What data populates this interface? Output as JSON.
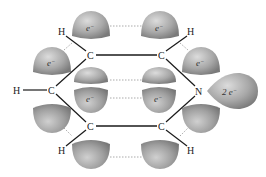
{
  "diagram": {
    "colors": {
      "background": "#ffffff",
      "lobe_light": "#d4d4d4",
      "lobe_dark": "#8a8a8a",
      "bond": "#1a1a1a",
      "dotted": "#aaaaaa",
      "text": "#222222"
    },
    "atoms": [
      {
        "id": "c1",
        "label": "C",
        "x": 90,
        "y": 55
      },
      {
        "id": "c2",
        "label": "C",
        "x": 162,
        "y": 55
      },
      {
        "id": "c3",
        "label": "C",
        "x": 52,
        "y": 90
      },
      {
        "id": "n",
        "label": "N",
        "x": 199,
        "y": 91
      },
      {
        "id": "c4",
        "label": "C",
        "x": 90,
        "y": 126
      },
      {
        "id": "c5",
        "label": "C",
        "x": 162,
        "y": 126
      },
      {
        "id": "h1",
        "label": "H",
        "x": 62,
        "y": 32
      },
      {
        "id": "h2",
        "label": "H",
        "x": 191,
        "y": 32
      },
      {
        "id": "h3",
        "label": "H",
        "x": 18,
        "y": 91
      },
      {
        "id": "h4",
        "label": "H",
        "x": 62,
        "y": 150
      },
      {
        "id": "h5",
        "label": "H",
        "x": 191,
        "y": 150
      }
    ],
    "electron_labels": {
      "single": "e",
      "superscript": "−",
      "lone_pair": "2 e"
    }
  }
}
